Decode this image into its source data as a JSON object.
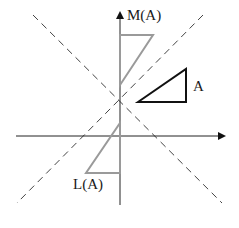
{
  "diagram": {
    "labels": {
      "original": "A",
      "reflection_m": "M(A)",
      "reflection_l": "L(A)"
    },
    "colors": {
      "axes": "#222222",
      "dashed": "#444444",
      "original_triangle": "#111111",
      "image_triangles": "#9a9a9a"
    },
    "elements": [
      "x-axis with arrow",
      "y-axis with arrow",
      "dashed diagonal line y=x",
      "dashed diagonal line y=-x",
      "triangle A",
      "triangle M(A)",
      "triangle L(A)"
    ]
  }
}
